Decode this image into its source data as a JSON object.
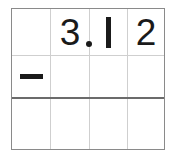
{
  "worksheet": {
    "title": "Vertical subtraction worksheet",
    "problem_expression": "3.12 -",
    "operator_symbol": "−",
    "operator_name": "minus",
    "decimal_point_symbol": ".",
    "colors": {
      "background": "#ffffff",
      "grid_line": "#cfcfcf",
      "grid_border": "#8a8a8a",
      "answer_rule": "#6b6b6b",
      "ink": "#1a1a1a"
    },
    "columns": [
      {
        "index": 0,
        "name": "operator-column"
      },
      {
        "index": 1,
        "name": "ones-column"
      },
      {
        "index": 2,
        "name": "tenths-column"
      },
      {
        "index": 3,
        "name": "hundredths-column"
      }
    ],
    "rows": [
      {
        "name": "minuend-row",
        "cells": [
          {
            "name": "minuend-operator-cell",
            "value": "",
            "kind": "empty"
          },
          {
            "name": "minuend-ones-cell",
            "value": "3",
            "kind": "digit",
            "has_decimal_point": true
          },
          {
            "name": "minuend-tenths-cell",
            "value": "1",
            "kind": "digit-one",
            "has_decimal_point": false
          },
          {
            "name": "minuend-hundredths-cell",
            "value": "2",
            "kind": "digit",
            "has_decimal_point": false
          }
        ]
      },
      {
        "name": "subtrahend-row",
        "cells": [
          {
            "name": "subtrahend-operator-cell",
            "value": "−",
            "kind": "minus"
          },
          {
            "name": "subtrahend-ones-cell",
            "value": "",
            "kind": "empty"
          },
          {
            "name": "subtrahend-tenths-cell",
            "value": "",
            "kind": "empty"
          },
          {
            "name": "subtrahend-hundredths-cell",
            "value": "",
            "kind": "empty"
          }
        ]
      },
      {
        "name": "answer-row",
        "cells": [
          {
            "name": "answer-operator-cell",
            "value": "",
            "kind": "empty"
          },
          {
            "name": "answer-ones-cell",
            "value": "",
            "kind": "empty"
          },
          {
            "name": "answer-tenths-cell",
            "value": "",
            "kind": "empty"
          },
          {
            "name": "answer-hundredths-cell",
            "value": "",
            "kind": "empty"
          }
        ]
      }
    ]
  }
}
